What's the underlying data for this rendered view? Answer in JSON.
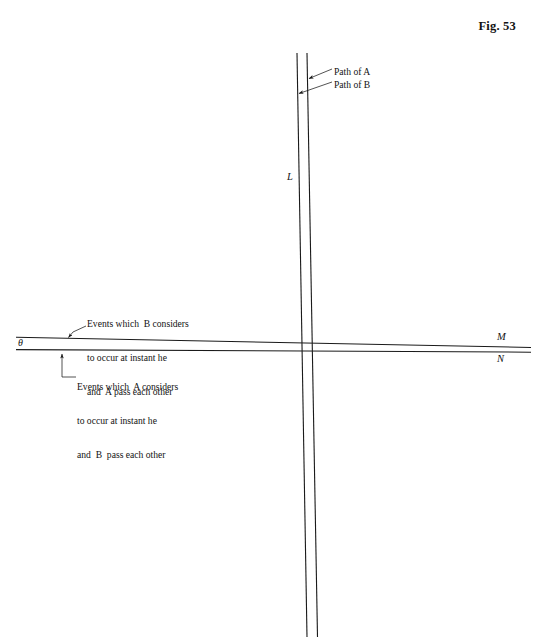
{
  "figure": {
    "caption": "Fig. 53",
    "background_color": "#ffffff",
    "line_color": "#1a1a1a",
    "text_color": "#131313"
  },
  "labels": {
    "path_of_a": "Path of A",
    "path_of_b": "Path of B",
    "axis_L": "L",
    "axis_M": "M",
    "axis_N": "N",
    "angle_theta": "θ"
  },
  "annotations": {
    "note_b": {
      "lines": [
        "Events which  B considers",
        "to occur at instant he",
        "and  A pass each other"
      ]
    },
    "note_a": {
      "lines": [
        "Events which  A considers",
        "to occur at instant he",
        "and  B  pass each other"
      ]
    }
  },
  "geometry": {
    "intersection": {
      "x": 307,
      "y": 344
    },
    "line_L_path_a": {
      "x1": 307,
      "y1": 53,
      "x2": 317,
      "y2": 637
    },
    "line_L_path_b": {
      "x1": 297,
      "y1": 53,
      "x2": 307,
      "y2": 637
    },
    "line_M": {
      "x1": 16,
      "y1": 337,
      "x2": 531,
      "y2": 347
    },
    "line_N": {
      "x1": 16,
      "y1": 349,
      "x2": 531,
      "y2": 352
    }
  }
}
